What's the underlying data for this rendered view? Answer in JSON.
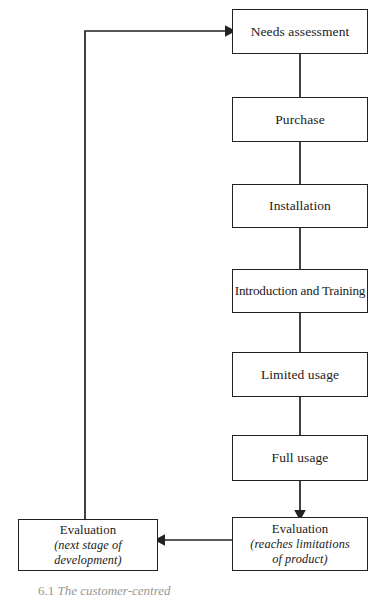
{
  "figure": {
    "caption_number": "6.1",
    "caption_text": "The customer-centred",
    "background_color": "#ffffff",
    "line_color": "#222222",
    "text_color": "#1a1a1a"
  },
  "nodes": [
    {
      "id": "needs-assessment",
      "label": "Needs assessment",
      "sub_label": "",
      "x": 232,
      "y": 9,
      "w": 136,
      "h": 45
    },
    {
      "id": "purchase",
      "label": "Purchase",
      "sub_label": "",
      "x": 232,
      "y": 97,
      "w": 136,
      "h": 45
    },
    {
      "id": "installation",
      "label": "Installation",
      "sub_label": "",
      "x": 232,
      "y": 184,
      "w": 136,
      "h": 44
    },
    {
      "id": "introduction-and-training",
      "label": "Introduction and Training",
      "sub_label": "",
      "x": 232,
      "y": 269,
      "w": 136,
      "h": 44
    },
    {
      "id": "limited-usage",
      "label": "Limited usage",
      "sub_label": "",
      "x": 232,
      "y": 352,
      "w": 136,
      "h": 45
    },
    {
      "id": "full-usage",
      "label": "Full usage",
      "sub_label": "",
      "x": 232,
      "y": 435,
      "w": 136,
      "h": 46
    },
    {
      "id": "evaluation-limitations",
      "label": "Evaluation",
      "sub_label_line1": "(reaches limitations",
      "sub_label_line2": "of product)",
      "x": 232,
      "y": 517,
      "w": 136,
      "h": 54
    },
    {
      "id": "evaluation-next-stage",
      "label": "Evaluation",
      "sub_label_line1": "(next stage of",
      "sub_label_line2": "development)",
      "x": 18,
      "y": 519,
      "w": 140,
      "h": 52
    }
  ],
  "edges": [
    {
      "id": "needs-to-purchase",
      "from": "needs-assessment",
      "to": "purchase",
      "arrow": false
    },
    {
      "id": "purchase-to-installation",
      "from": "purchase",
      "to": "installation",
      "arrow": false
    },
    {
      "id": "installation-to-introduction",
      "from": "installation",
      "to": "introduction-and-training",
      "arrow": false
    },
    {
      "id": "introduction-to-limited-usage",
      "from": "introduction-and-training",
      "to": "limited-usage",
      "arrow": false
    },
    {
      "id": "limited-to-full-usage",
      "from": "limited-usage",
      "to": "full-usage",
      "arrow": false
    },
    {
      "id": "full-usage-to-evaluation",
      "from": "full-usage",
      "to": "evaluation-limitations",
      "arrow": true
    },
    {
      "id": "evaluation-limitations-to-evaluation-next-stage",
      "from": "evaluation-limitations",
      "to": "evaluation-next-stage",
      "arrow": true
    },
    {
      "id": "evaluation-next-stage-to-needs-assessment",
      "from": "evaluation-next-stage",
      "to": "needs-assessment",
      "arrow": true
    }
  ]
}
